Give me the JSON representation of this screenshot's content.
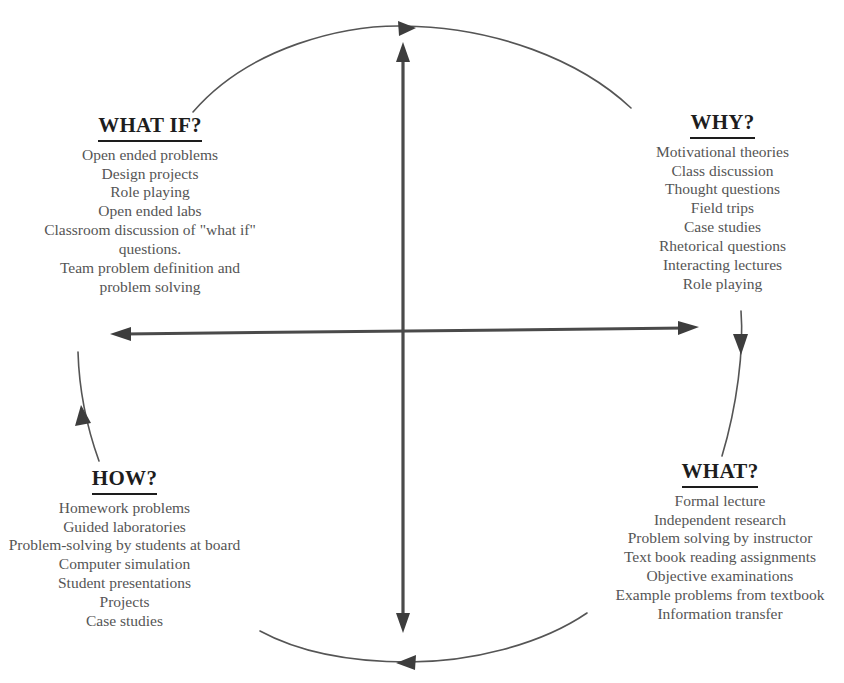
{
  "diagram": {
    "line_color": "#4a4a4a",
    "text_color": "#555555",
    "heading_color": "#1d1d1d",
    "background": "#ffffff"
  },
  "quadrants": {
    "what_if": {
      "title": "WHAT IF?",
      "items": [
        "Open ended problems",
        "Design projects",
        "Role playing",
        "Open ended labs",
        "Classroom discussion of \"what if\" questions.",
        "Team problem definition and problem solving"
      ]
    },
    "why": {
      "title": "WHY?",
      "items": [
        "Motivational theories",
        "Class discussion",
        "Thought questions",
        "Field trips",
        "Case studies",
        "Rhetorical questions",
        "Interacting lectures",
        "Role playing"
      ]
    },
    "how": {
      "title": "HOW?",
      "items": [
        "Homework problems",
        "Guided laboratories",
        "Problem-solving by students at board",
        "Computer simulation",
        "Student presentations",
        "Projects",
        "Case studies"
      ]
    },
    "what": {
      "title": "WHAT?",
      "items": [
        "Formal lecture",
        "Independent research",
        "Problem solving by instructor",
        "Text book reading assignments",
        "Objective examinations",
        "Example problems from textbook",
        "Information transfer"
      ]
    }
  },
  "axes": {
    "vertical_label": "vertical-double-arrow-axis",
    "horizontal_label": "horizontal-double-arrow-axis"
  },
  "cycle_arcs": [
    {
      "name": "top-arc",
      "direction": "rightward"
    },
    {
      "name": "right-arc",
      "direction": "downward"
    },
    {
      "name": "bottom-arc",
      "direction": "leftward"
    },
    {
      "name": "left-arc",
      "direction": "upward"
    }
  ]
}
